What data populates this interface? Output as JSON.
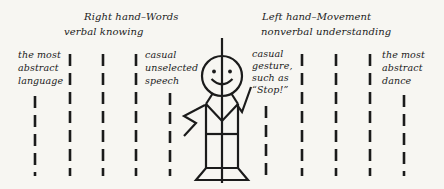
{
  "diagram": {
    "header_left": {
      "lines": [
        "Right hand–Words",
        "verbal knowing"
      ]
    },
    "header_right": {
      "lines": [
        "Left hand–Movement",
        "nonverbal understanding"
      ]
    },
    "label_far_left": {
      "lines": [
        "the most",
        "abstract",
        "language"
      ]
    },
    "label_mid_left": {
      "lines": [
        "casual",
        "unselected",
        "speech"
      ]
    },
    "label_mid_right": {
      "lines": [
        "casual",
        "gesture,",
        "such as",
        "“Stop!”"
      ]
    },
    "label_far_right": {
      "lines": [
        "the most",
        "abstract",
        "dance"
      ]
    },
    "colors": {
      "ink": "#1b1b1b",
      "paper": "#f7f6f2"
    }
  }
}
